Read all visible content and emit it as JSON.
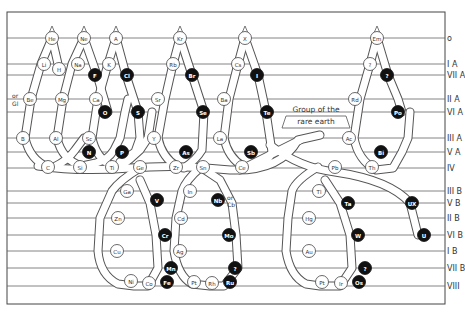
{
  "diagram": {
    "frame": {
      "x": 7,
      "y": 12,
      "w": 438,
      "h": 292
    },
    "rows": [
      {
        "label": "o",
        "y": 38
      },
      {
        "label": "I A",
        "y": 64
      },
      {
        "label": "VII A",
        "y": 75
      },
      {
        "label": "II A",
        "y": 99
      },
      {
        "label": "VI A",
        "y": 112
      },
      {
        "label": "III A",
        "y": 138
      },
      {
        "label": "V A",
        "y": 152
      },
      {
        "label": "IV",
        "y": 168
      },
      {
        "label": "III B",
        "y": 191
      },
      {
        "label": "V B",
        "y": 203
      },
      {
        "label": "II B",
        "y": 218
      },
      {
        "label": "VI B",
        "y": 235
      },
      {
        "label": "I B",
        "y": 251
      },
      {
        "label": "VII B",
        "y": 268
      },
      {
        "label": "VIII",
        "y": 286
      }
    ],
    "tubes": [
      "M52,38 L41,64 L31,99 L25,138 Q30,160 48,167 L54,167 Q68,160 75,150 L84,138",
      "M52,38 L58,64",
      "M84,38 L72,64 L63,99 L57,138 Q62,160 82,166 L96,163 Q108,160 114,150 L120,138 L125,112 L128,99",
      "M84,38 L97,75 L108,112",
      "M116,38 L108,64 L98,99 L92,138 Q96,158 112,166 L118,168 Q130,160 140,150 L148,138 L152,112",
      "M116,38 L126,75 L138,112 L140,138 L135,152 L120,162",
      "M180,38 L173,64 L165,99 L158,138 Q162,158 178,167 L184,168 Q196,160 202,150 L204,112",
      "M180,38 L192,75 L204,112",
      "M245,38 L238,64 L229,99 L224,138 Q228,158 244,167 L254,168 Q268,162 272,152 L266,112",
      "M245,38 L258,75 L266,112",
      "M377,38 L370,64 L360,99 L354,138 Q358,160 376,170 L393,168 L402,152 L408,138 L410,112",
      "M377,38 L388,75 L398,99 L402,112",
      "M38,166 Q80,172 130,168 Q180,164 230,170 Q280,172 298,140 L320,135",
      "M140,168 Q120,180 112,191 L100,218 L98,251 Q100,275 118,284 L134,286 L148,286 L158,268 L156,235 L150,203 L140,180",
      "M200,168 Q186,180 182,191 L176,218 L174,251 Q178,276 192,284 L210,286 L224,286 L238,268 L236,235 L232,203 L220,180 L205,170",
      "M318,167 Q296,180 292,191 L288,218 L286,251 Q290,276 306,284 L320,286 L340,286 L352,268 L350,235 L340,203 L325,180",
      "M270,145 Q300,168 335,172 Q390,180 410,203 L418,235",
      "M240,170 Q270,155 300,140"
    ],
    "elements": [
      {
        "sym": "He",
        "x": 52,
        "y": 38,
        "solid": false
      },
      {
        "sym": "Ne",
        "x": 84,
        "y": 38,
        "solid": false
      },
      {
        "sym": "A",
        "x": 116,
        "y": 38,
        "solid": false
      },
      {
        "sym": "Kr",
        "x": 180,
        "y": 38,
        "solid": false
      },
      {
        "sym": "X",
        "x": 245,
        "y": 38,
        "solid": false
      },
      {
        "sym": "Em",
        "x": 377,
        "y": 38,
        "solid": false
      },
      {
        "sym": "Li",
        "x": 44,
        "y": 64,
        "solid": false
      },
      {
        "sym": "H",
        "x": 59,
        "y": 69,
        "solid": false
      },
      {
        "sym": "Na",
        "x": 78,
        "y": 64,
        "solid": false
      },
      {
        "sym": "K",
        "x": 109,
        "y": 64,
        "solid": false
      },
      {
        "sym": "Rb",
        "x": 173,
        "y": 64,
        "solid": false
      },
      {
        "sym": "Cs",
        "x": 238,
        "y": 64,
        "solid": false
      },
      {
        "sym": "?",
        "x": 370,
        "y": 64,
        "solid": false
      },
      {
        "sym": "F",
        "x": 95,
        "y": 75,
        "solid": true
      },
      {
        "sym": "Cl",
        "x": 127,
        "y": 75,
        "solid": true
      },
      {
        "sym": "Br",
        "x": 192,
        "y": 75,
        "solid": true
      },
      {
        "sym": "I",
        "x": 257,
        "y": 75,
        "solid": true
      },
      {
        "sym": "?",
        "x": 387,
        "y": 75,
        "solid": true
      },
      {
        "sym": "Be",
        "x": 30,
        "y": 99,
        "solid": false
      },
      {
        "sym": "Mg",
        "x": 62,
        "y": 99,
        "solid": false
      },
      {
        "sym": "Ca",
        "x": 96,
        "y": 99,
        "solid": false
      },
      {
        "sym": "Sr",
        "x": 158,
        "y": 99,
        "solid": false
      },
      {
        "sym": "Ba",
        "x": 224,
        "y": 99,
        "solid": false
      },
      {
        "sym": "Rd",
        "x": 355,
        "y": 99,
        "solid": false
      },
      {
        "sym": "O",
        "x": 105,
        "y": 112,
        "solid": true
      },
      {
        "sym": "S",
        "x": 138,
        "y": 112,
        "solid": true
      },
      {
        "sym": "Se",
        "x": 203,
        "y": 112,
        "solid": true
      },
      {
        "sym": "Te",
        "x": 267,
        "y": 112,
        "solid": true
      },
      {
        "sym": "Po",
        "x": 398,
        "y": 112,
        "solid": true
      },
      {
        "sym": "B",
        "x": 23,
        "y": 138,
        "solid": false
      },
      {
        "sym": "Al",
        "x": 56,
        "y": 138,
        "solid": false
      },
      {
        "sym": "Sc",
        "x": 89,
        "y": 138,
        "solid": false
      },
      {
        "sym": "Y",
        "x": 154,
        "y": 138,
        "solid": false
      },
      {
        "sym": "La",
        "x": 220,
        "y": 138,
        "solid": false
      },
      {
        "sym": "Ac",
        "x": 349,
        "y": 138,
        "solid": false
      },
      {
        "sym": "N",
        "x": 89,
        "y": 152,
        "solid": true
      },
      {
        "sym": "P",
        "x": 122,
        "y": 152,
        "solid": true
      },
      {
        "sym": "As",
        "x": 186,
        "y": 152,
        "solid": true
      },
      {
        "sym": "Sb",
        "x": 251,
        "y": 152,
        "solid": true
      },
      {
        "sym": "Bi",
        "x": 381,
        "y": 152,
        "solid": true
      },
      {
        "sym": "C",
        "x": 48,
        "y": 167,
        "solid": false
      },
      {
        "sym": "Si",
        "x": 80,
        "y": 167,
        "solid": false
      },
      {
        "sym": "Ti",
        "x": 112,
        "y": 167,
        "solid": false
      },
      {
        "sym": "Ge",
        "x": 140,
        "y": 167,
        "solid": false
      },
      {
        "sym": "Zr",
        "x": 176,
        "y": 167,
        "solid": false
      },
      {
        "sym": "Sn",
        "x": 203,
        "y": 167,
        "solid": false
      },
      {
        "sym": "Ce",
        "x": 242,
        "y": 167,
        "solid": false
      },
      {
        "sym": "Pb",
        "x": 335,
        "y": 167,
        "solid": false
      },
      {
        "sym": "Th",
        "x": 372,
        "y": 167,
        "solid": false
      },
      {
        "sym": "Ga",
        "x": 127,
        "y": 191,
        "solid": false
      },
      {
        "sym": "In",
        "x": 190,
        "y": 191,
        "solid": false
      },
      {
        "sym": "Tl",
        "x": 319,
        "y": 191,
        "solid": false
      },
      {
        "sym": "V",
        "x": 157,
        "y": 200,
        "solid": true
      },
      {
        "sym": "Nb",
        "x": 218,
        "y": 200,
        "solid": true
      },
      {
        "sym": "Ta",
        "x": 348,
        "y": 203,
        "solid": true
      },
      {
        "sym": "UX",
        "x": 412,
        "y": 203,
        "solid": true
      },
      {
        "sym": "Zn",
        "x": 118,
        "y": 218,
        "solid": false
      },
      {
        "sym": "Cd",
        "x": 181,
        "y": 218,
        "solid": false
      },
      {
        "sym": "Hg",
        "x": 309,
        "y": 218,
        "solid": false
      },
      {
        "sym": "Cr",
        "x": 165,
        "y": 235,
        "solid": true
      },
      {
        "sym": "Mo",
        "x": 229,
        "y": 235,
        "solid": true
      },
      {
        "sym": "W",
        "x": 358,
        "y": 235,
        "solid": true
      },
      {
        "sym": "U",
        "x": 424,
        "y": 235,
        "solid": true
      },
      {
        "sym": "Cu",
        "x": 117,
        "y": 251,
        "solid": false
      },
      {
        "sym": "Ag",
        "x": 180,
        "y": 251,
        "solid": false
      },
      {
        "sym": "Au",
        "x": 309,
        "y": 251,
        "solid": false
      },
      {
        "sym": "Mn",
        "x": 171,
        "y": 268,
        "solid": true
      },
      {
        "sym": "?",
        "x": 235,
        "y": 268,
        "solid": true
      },
      {
        "sym": "?",
        "x": 365,
        "y": 268,
        "solid": true
      },
      {
        "sym": "Ni",
        "x": 131,
        "y": 281,
        "solid": false
      },
      {
        "sym": "Co",
        "x": 149,
        "y": 283,
        "solid": false
      },
      {
        "sym": "Fe",
        "x": 167,
        "y": 282,
        "solid": true
      },
      {
        "sym": "Pt",
        "x": 194,
        "y": 282,
        "solid": false
      },
      {
        "sym": "Rh",
        "x": 212,
        "y": 283,
        "solid": false
      },
      {
        "sym": "Ru",
        "x": 230,
        "y": 282,
        "solid": true
      },
      {
        "sym": "Pt",
        "x": 322,
        "y": 282,
        "solid": false
      },
      {
        "sym": "Ir",
        "x": 341,
        "y": 283,
        "solid": false
      },
      {
        "sym": "Os",
        "x": 359,
        "y": 282,
        "solid": true
      }
    ],
    "notes": [
      {
        "text": "or",
        "x": 12,
        "y": 98
      },
      {
        "text": "Gl",
        "x": 12,
        "y": 106
      },
      {
        "text": "or",
        "x": 227,
        "y": 200
      },
      {
        "text": "Cb",
        "x": 227,
        "y": 207
      }
    ],
    "callout": {
      "line1": "Group of the",
      "line2": "rare  earth",
      "x": 282,
      "y": 104,
      "w": 68,
      "h": 24
    }
  }
}
